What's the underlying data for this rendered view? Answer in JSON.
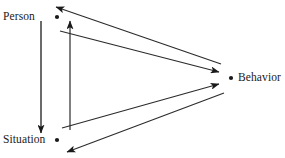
{
  "diagram": {
    "type": "triangular-reciprocal-causation",
    "background_color": "#ffffff",
    "line_color": "#1a1a1a",
    "text_color": "#1a1a1a",
    "nodes": [
      {
        "id": "person",
        "label": "Person",
        "label_x": 3,
        "label_y": 11,
        "dot_x": 57,
        "dot_y": 17,
        "dot_r": 2.1
      },
      {
        "id": "situation",
        "label": "Situation",
        "label_x": 3,
        "label_y": 134,
        "dot_x": 57,
        "dot_y": 140,
        "dot_r": 2.1
      },
      {
        "id": "behavior",
        "label": "Behavior",
        "label_x": 238,
        "label_y": 72,
        "dot_x": 231,
        "dot_y": 78,
        "dot_r": 2.1
      }
    ],
    "edges": [
      {
        "id": "person-to-situation",
        "from": "person",
        "to": "situation",
        "x1": 41,
        "y1": 21,
        "x2": 41,
        "y2": 133,
        "arrow_at": "end"
      },
      {
        "id": "situation-to-person",
        "from": "situation",
        "to": "person",
        "x1": 70,
        "y1": 130,
        "x2": 70,
        "y2": 21,
        "arrow_at": "end"
      },
      {
        "id": "behavior-to-person",
        "from": "behavior",
        "to": "person",
        "x1": 221,
        "y1": 64,
        "x2": 56,
        "y2": 7,
        "arrow_at": "end"
      },
      {
        "id": "person-to-behavior",
        "from": "person",
        "to": "behavior",
        "x1": 60,
        "y1": 31,
        "x2": 219,
        "y2": 72,
        "arrow_at": "end"
      },
      {
        "id": "situation-to-behavior",
        "from": "situation",
        "to": "behavior",
        "x1": 62,
        "y1": 128,
        "x2": 219,
        "y2": 84,
        "arrow_at": "end"
      },
      {
        "id": "behavior-to-situation",
        "from": "behavior",
        "to": "situation",
        "x1": 224,
        "y1": 93,
        "x2": 67,
        "y2": 152,
        "arrow_at": "end"
      }
    ]
  }
}
